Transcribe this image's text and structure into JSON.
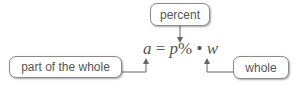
{
  "diagram": {
    "labels": {
      "percent": "percent",
      "part": "part of the whole",
      "whole": "whole"
    },
    "formula": {
      "a": "a",
      "eq": " = ",
      "p": "p",
      "pct": "%",
      "dot": " • ",
      "w": "w"
    },
    "colors": {
      "text": "#555555",
      "border": "#8a8a8a",
      "arrow": "#666666"
    }
  }
}
